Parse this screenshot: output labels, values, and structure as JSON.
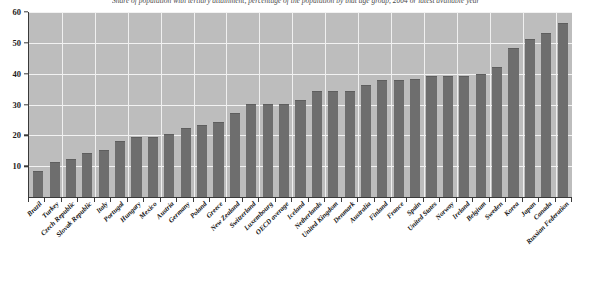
{
  "chart_data": {
    "type": "bar",
    "title": "Share of population with tertiary attainment, percentage of the population by that age group, 2004 or latest available year",
    "subtitle": "",
    "xlabel": "",
    "ylabel": "",
    "ylim": [
      0,
      60
    ],
    "yticks": [
      10,
      20,
      30,
      40,
      50,
      60
    ],
    "grid": true,
    "legend": "none",
    "bar_color": "#6e6e6e",
    "plot_background": "#bdbdbd",
    "categories": [
      "Brazil",
      "Turkey",
      "Czech Republic",
      "Slovak Republic",
      "Italy",
      "Portugal",
      "Hungary",
      "Mexico",
      "Austria",
      "Germany",
      "Poland",
      "Greece",
      "New Zealand",
      "Switzerland",
      "Luxembourg",
      "OECD average",
      "Iceland",
      "Netherlands",
      "United Kingdom",
      "Denmark",
      "Australia",
      "Finland",
      "France",
      "Spain",
      "United States",
      "Norway",
      "Ireland",
      "Belgium",
      "Sweden",
      "Korea",
      "Japan",
      "Canada",
      "Russian Federation"
    ],
    "values": [
      8,
      11,
      12,
      14,
      15,
      18,
      19,
      19,
      20,
      22,
      23,
      24,
      27,
      30,
      30,
      30,
      31,
      34,
      34,
      34,
      36,
      37.5,
      37.5,
      38,
      39,
      39,
      39,
      39.5,
      42,
      48,
      51,
      53,
      56
    ]
  }
}
